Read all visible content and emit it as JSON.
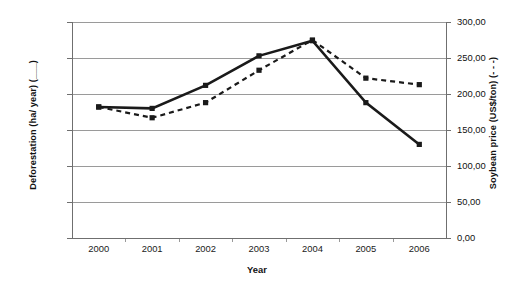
{
  "chart_data": {
    "type": "line",
    "title": "",
    "xlabel": "Year",
    "categories": [
      "2000",
      "2001",
      "2002",
      "2003",
      "2004",
      "2005",
      "2006"
    ],
    "x": [
      2000,
      2001,
      2002,
      2003,
      2004,
      2005,
      2006
    ],
    "grid": true,
    "legend_position": "none",
    "axes": {
      "left": {
        "label": "Deforestation (ha/ year) (___)",
        "ticks": [
          "0",
          "5.000",
          "10.000",
          "15.000",
          "20.000",
          "25.000",
          "30.000"
        ],
        "tick_values": [
          0,
          5000,
          10000,
          15000,
          20000,
          25000,
          30000
        ],
        "ylim": [
          0,
          30000
        ]
      },
      "right": {
        "label": "Soybean price (US$/ton) (- - -)",
        "ticks": [
          "0,00",
          "50,00",
          "100,00",
          "150,00",
          "200,00",
          "250,00",
          "300,00"
        ],
        "tick_values": [
          0,
          50,
          100,
          150,
          200,
          250,
          300
        ],
        "ylim": [
          0,
          300
        ]
      }
    },
    "series": [
      {
        "name": "Deforestation (ha/ year)",
        "axis": "left",
        "style": "solid",
        "marker": "square",
        "color": "#1a1a1a",
        "values": [
          18200,
          18000,
          21200,
          25300,
          27400,
          18800,
          13000
        ]
      },
      {
        "name": "Soybean price (US$/ton)",
        "axis": "right",
        "style": "dashed",
        "marker": "square",
        "color": "#1a1a1a",
        "values": [
          182,
          167,
          188,
          233,
          275,
          222,
          213
        ]
      }
    ]
  }
}
